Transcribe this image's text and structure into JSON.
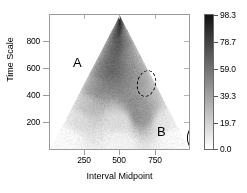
{
  "figure": {
    "title": "",
    "background": "#ffffff"
  },
  "axes": {
    "xlabel": "Interval Midpoint",
    "ylabel": "Time Scale",
    "x_ticks": [
      "250",
      "500",
      "750"
    ],
    "y_ticks": [
      "800",
      "600",
      "400",
      "200"
    ]
  },
  "colorbar": {
    "ticks": [
      "98.3",
      "78.7",
      "59.0",
      "39.3",
      "19.7",
      "0.0"
    ],
    "low_color": "#ffffff",
    "high_color": "#1a1a1a"
  },
  "annotations": {
    "a_label": "A",
    "b_label": "B"
  },
  "chart_data": {
    "type": "heatmap",
    "title": "",
    "xlabel": "Interval Midpoint",
    "ylabel": "Time Scale",
    "xlim": [
      0,
      1000
    ],
    "ylim": [
      0,
      1000
    ],
    "x_ticks": [
      250,
      500,
      750
    ],
    "y_ticks": [
      200,
      400,
      600,
      800
    ],
    "grid": false,
    "colormap": "grayscale-reversed",
    "colorbar_label": "",
    "colorbar_ticks": [
      0.0,
      19.7,
      39.3,
      59.0,
      78.7,
      98.3
    ],
    "zlim": [
      0.0,
      98.3
    ],
    "cone_of_influence": {
      "shape": "triangle",
      "apex": [
        500,
        1000
      ],
      "base_left": [
        0,
        0
      ],
      "base_right": [
        1000,
        0
      ],
      "note": "values only defined inside triangular cone of influence"
    },
    "features": [
      {
        "label": "A",
        "marker": "dashed-ellipse",
        "center": [
          330,
          600
        ],
        "width": 110,
        "height": 190,
        "intensity": 82
      },
      {
        "label": "B",
        "marker": "solid-ellipse",
        "center": [
          660,
          255
        ],
        "width": 110,
        "height": 175,
        "intensity": 70
      }
    ],
    "hotspots": [
      {
        "x": 500,
        "y": 980,
        "value": 88
      },
      {
        "x": 460,
        "y": 900,
        "value": 84
      },
      {
        "x": 380,
        "y": 760,
        "value": 78
      },
      {
        "x": 335,
        "y": 610,
        "value": 83
      },
      {
        "x": 300,
        "y": 470,
        "value": 72
      },
      {
        "x": 560,
        "y": 850,
        "value": 66
      },
      {
        "x": 600,
        "y": 700,
        "value": 60
      },
      {
        "x": 640,
        "y": 520,
        "value": 62
      },
      {
        "x": 660,
        "y": 330,
        "value": 68
      },
      {
        "x": 660,
        "y": 250,
        "value": 72
      },
      {
        "x": 700,
        "y": 420,
        "value": 58
      },
      {
        "x": 250,
        "y": 330,
        "value": 48
      },
      {
        "x": 200,
        "y": 220,
        "value": 30
      },
      {
        "x": 820,
        "y": 200,
        "value": 26
      },
      {
        "x": 500,
        "y": 200,
        "value": 22
      },
      {
        "x": 500,
        "y": 60,
        "value": 10
      },
      {
        "x": 120,
        "y": 80,
        "value": 8
      },
      {
        "x": 880,
        "y": 80,
        "value": 8
      }
    ]
  }
}
